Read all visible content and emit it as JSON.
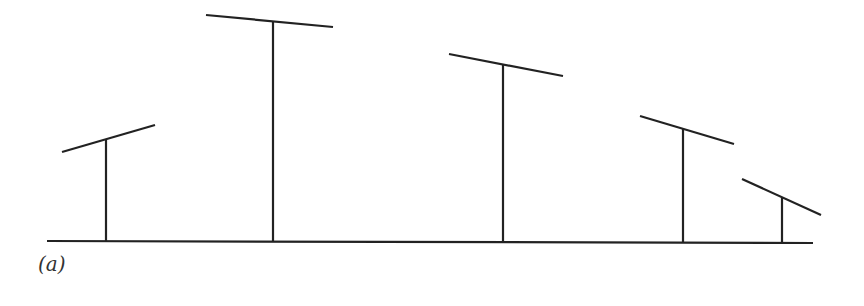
{
  "figure": {
    "label": "(a)",
    "baseline": {
      "x1": 47,
      "y1": 241,
      "x2": 813,
      "y2": 243
    },
    "posts": [
      {
        "name": "post-1",
        "stem": {
          "x": 106,
          "y_top": 140,
          "y_bottom": 241
        },
        "bar": {
          "x1": 62,
          "y1": 152,
          "x2": 155,
          "y2": 125
        }
      },
      {
        "name": "post-2",
        "stem": {
          "x": 273,
          "y_top": 22,
          "y_bottom": 241
        },
        "bar": {
          "x1": 206,
          "y1": 15,
          "x2": 333,
          "y2": 27
        }
      },
      {
        "name": "post-3",
        "stem": {
          "x": 503,
          "y_top": 65,
          "y_bottom": 242
        },
        "bar": {
          "x1": 449,
          "y1": 54,
          "x2": 563,
          "y2": 76
        }
      },
      {
        "name": "post-4",
        "stem": {
          "x": 683,
          "y_top": 129,
          "y_bottom": 243
        },
        "bar": {
          "x1": 640,
          "y1": 116,
          "x2": 734,
          "y2": 144
        }
      },
      {
        "name": "post-5",
        "stem": {
          "x": 782,
          "y_top": 197,
          "y_bottom": 243
        },
        "bar": {
          "x1": 742,
          "y1": 179,
          "x2": 821,
          "y2": 215
        }
      }
    ]
  }
}
